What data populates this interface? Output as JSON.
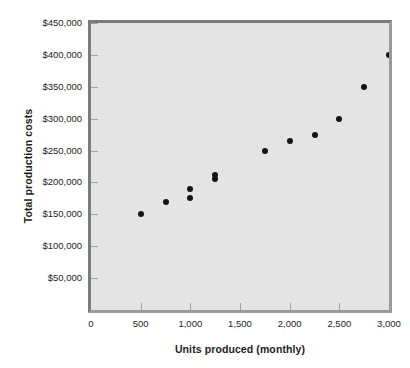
{
  "chart_data": {
    "type": "scatter",
    "title": "",
    "xlabel": "Units produced (monthly)",
    "ylabel": "Total production costs",
    "xlim": [
      0,
      3000
    ],
    "ylim": [
      0,
      450000
    ],
    "grid": false,
    "legend": null,
    "x_ticks": [
      0,
      500,
      1000,
      1500,
      2000,
      2500,
      3000
    ],
    "x_tick_labels": [
      "0",
      "500",
      "1,000",
      "1,500",
      "2,000",
      "2,500",
      "3,000"
    ],
    "y_ticks": [
      50000,
      100000,
      150000,
      200000,
      250000,
      300000,
      350000,
      400000,
      450000
    ],
    "y_tick_labels": [
      "$50,000",
      "$100,000",
      "$150,000",
      "$200,000",
      "$250,000",
      "$300,000",
      "$350,000",
      "$400,000",
      "$450,000"
    ],
    "marker_color": "#141414",
    "plot_background": "#e4e4e4",
    "frame_color": "#7c7c7c",
    "x": [
      500,
      750,
      1000,
      1000,
      1250,
      1250,
      1750,
      2000,
      2250,
      2500,
      2750,
      3000
    ],
    "y": [
      150000,
      170000,
      175000,
      190000,
      205000,
      212000,
      250000,
      265000,
      275000,
      300000,
      350000,
      400000
    ],
    "points": [
      {
        "x": 500,
        "y": 150000
      },
      {
        "x": 750,
        "y": 170000
      },
      {
        "x": 1000,
        "y": 175000
      },
      {
        "x": 1000,
        "y": 190000
      },
      {
        "x": 1250,
        "y": 205000
      },
      {
        "x": 1250,
        "y": 212000
      },
      {
        "x": 1750,
        "y": 250000
      },
      {
        "x": 2000,
        "y": 265000
      },
      {
        "x": 2250,
        "y": 275000
      },
      {
        "x": 2500,
        "y": 300000
      },
      {
        "x": 2750,
        "y": 350000
      },
      {
        "x": 3000,
        "y": 400000
      }
    ]
  }
}
